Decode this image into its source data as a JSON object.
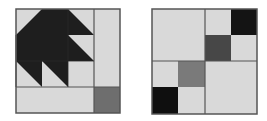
{
  "figures": [
    {
      "name": "bear-paw-like-quilt-block",
      "description": "3x3 half-square-triangle motif with right column strip and bottom strip; dark square at bottom-right corner",
      "colors": {
        "light": "#d9d9d9",
        "dark": "#1e1e1e",
        "mid": "#6e6e6e",
        "line": "#555555"
      }
    },
    {
      "name": "four-patch-quilt-block",
      "description": "2x2 quadrant block; top-right and bottom-left quadrants subdivided into 2x2 small squares",
      "cells": {
        "top_left": "light",
        "top_right": [
          "light",
          "black",
          "dark-gray",
          "light"
        ],
        "bottom_left": [
          "light",
          "gray",
          "black",
          "light"
        ],
        "bottom_right": "light"
      },
      "colors": {
        "light": "#d9d9d9",
        "black": "#141414",
        "dark_gray": "#474747",
        "gray": "#7a7a7a",
        "line": "#555555"
      }
    }
  ]
}
